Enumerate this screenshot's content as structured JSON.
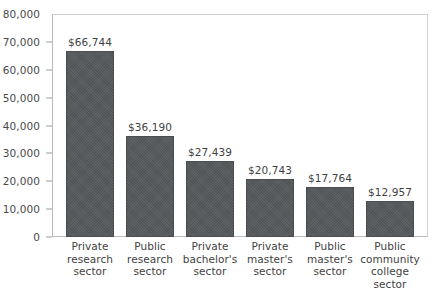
{
  "chart_data": {
    "type": "bar",
    "title": "",
    "subtitle": "",
    "xlabel": "",
    "ylabel": "",
    "ylim": [
      0,
      80000
    ],
    "y_ticks": [
      0,
      10000,
      20000,
      30000,
      40000,
      50000,
      60000,
      70000,
      80000
    ],
    "y_tick_labels": [
      "0",
      "10,000",
      "20,000",
      "30,000",
      "40,000",
      "50,000",
      "60,000",
      "70,000",
      "80,000"
    ],
    "grid": false,
    "legend": null,
    "legend_position": "none",
    "categories": [
      "Private research sector",
      "Public research sector",
      "Private bachelor's sector",
      "Private master's sector",
      "Public master's sector",
      "Public community college sector"
    ],
    "category_label_lines": [
      [
        "Private",
        "research",
        "sector"
      ],
      [
        "Public",
        "research",
        "sector"
      ],
      [
        "Private",
        "bachelor's",
        "sector"
      ],
      [
        "Private",
        "master's",
        "sector"
      ],
      [
        "Public",
        "master's",
        "sector"
      ],
      [
        "Public",
        "community",
        "college",
        "sector"
      ]
    ],
    "values": [
      66744,
      36190,
      27439,
      20743,
      17764,
      12957
    ],
    "value_labels": [
      "$66,744",
      "$36,190",
      "$27,439",
      "$20,743",
      "$17,764",
      "$12,957"
    ],
    "bar_color": "#55585a",
    "bar_edge_color": "#4b4e50",
    "axis_color": "#b9babc",
    "text_color": "#3f3f3f",
    "background_color": "#ffffff"
  }
}
